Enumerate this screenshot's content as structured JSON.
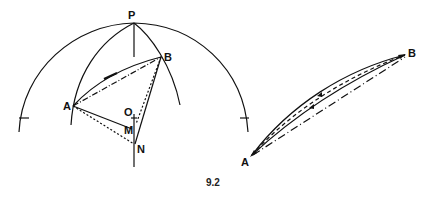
{
  "figure": {
    "caption": "9.2",
    "left_diagram": {
      "labels": {
        "P": "P",
        "A": "A",
        "B": "B",
        "O": "O",
        "M": "M",
        "N": "N"
      }
    },
    "right_diagram": {
      "labels": {
        "A": "A",
        "B": "B"
      }
    },
    "colors": {
      "stroke": "#111111",
      "background": "#ffffff"
    }
  }
}
